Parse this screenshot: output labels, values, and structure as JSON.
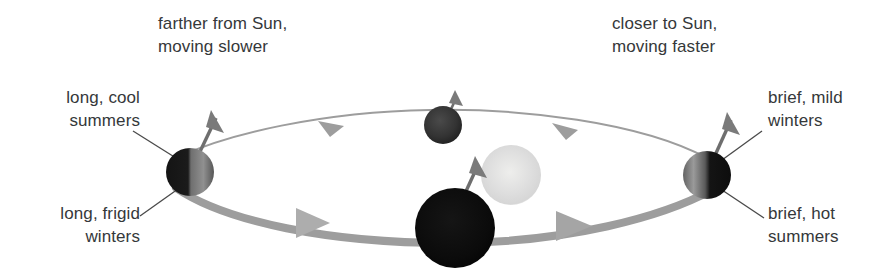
{
  "figure": {
    "background_color": "#ffffff",
    "text_color": "#35383a"
  },
  "labels": {
    "farther_from_sun": "farther from Sun,\nmoving slower",
    "closer_to_sun": "closer to Sun,\nmoving faster",
    "long_cool_summers": "long, cool\nsummers",
    "long_frigid_winters": "long, frigid\nwinters",
    "brief_mild_winters": "brief, mild\nwinters",
    "brief_hot_summers": "brief, hot\nsummers"
  },
  "bodies": {
    "sun": {
      "name": "sun",
      "cx": 511,
      "cy": 175,
      "r": 30,
      "color": "#dcdcdc"
    },
    "planet_aphelion": {
      "name": "planet-aphelion-left",
      "cx": 190,
      "cy": 172,
      "r": 24,
      "lit_side": "right",
      "dark_color": "#1a1a1a",
      "lit_color": "#8a8a8a"
    },
    "planet_perihelion": {
      "name": "planet-perihelion-right",
      "cx": 707,
      "cy": 175,
      "r": 24,
      "lit_side": "left",
      "dark_color": "#111111",
      "lit_color": "#8f8f8f"
    },
    "planet_top": {
      "name": "planet-far-top",
      "cx": 443,
      "cy": 125,
      "r": 19,
      "dark_color": "#3a3a3a"
    },
    "planet_bottom": {
      "name": "planet-near-bottom",
      "cx": 455,
      "cy": 228,
      "r": 40,
      "dark_color": "#0d0d0d"
    }
  },
  "orbit": {
    "far_segment": {
      "description": "thin arc, slow motion, above the sun",
      "stroke": "#9a9a9a",
      "width": 2,
      "direction": "right-to-left"
    },
    "near_segment": {
      "description": "thick band, fast motion, below the sun",
      "stroke": "#9a9a9a",
      "width": 8,
      "direction": "left-to-right"
    }
  },
  "leader_lines": {
    "stroke": "#4a4a4a",
    "width": 1.3
  }
}
